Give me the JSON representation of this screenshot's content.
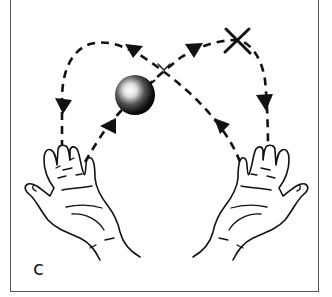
{
  "figure": {
    "panel_label": "c",
    "elements": {
      "ball": {
        "cx": 135,
        "cy": 95,
        "r": 20
      },
      "peak_marker": {
        "symbol": "X",
        "cx": 237,
        "cy": 40
      },
      "left_hand": {
        "position": "bottom-left",
        "orientation": "palm-up"
      },
      "right_hand": {
        "position": "bottom-right",
        "orientation": "palm-up"
      }
    },
    "paths": [
      {
        "name": "right-to-left-throw",
        "direction": "from right hand up-left over the top down into left hand",
        "arrows": 3
      },
      {
        "name": "left-to-right-throw",
        "direction": "from left hand up-right through X down into right hand",
        "arrows": 3
      }
    ],
    "colors": {
      "ink": "#111111",
      "background": "#ffffff",
      "frame": "#555555"
    }
  }
}
